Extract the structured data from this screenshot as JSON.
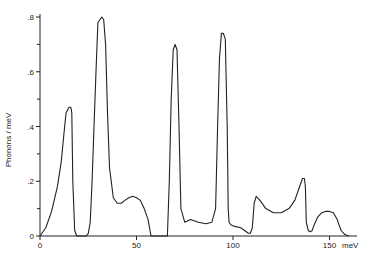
{
  "chart_data": {
    "type": "line",
    "title": "",
    "xlabel": "meV",
    "ylabel": "Phonons / meV",
    "xlim": [
      0,
      175
    ],
    "ylim": [
      0,
      0.8
    ],
    "x_ticks": [
      0,
      50,
      100,
      150
    ],
    "x_tick_labels": [
      "0",
      "50",
      "100",
      "150"
    ],
    "y_ticks": [
      0,
      0.2,
      0.4,
      0.6,
      0.8
    ],
    "y_tick_labels": [
      "0",
      ".2",
      ".4",
      ".6",
      ".8"
    ],
    "y_minor_ticks": [
      0.1,
      0.3,
      0.5,
      0.7
    ],
    "grid": false,
    "legend": null,
    "series": [
      {
        "name": "phonon density of states",
        "x": [
          0,
          3,
          6,
          9,
          11,
          12.5,
          13.5,
          15,
          16,
          16.5,
          17,
          18,
          19,
          22,
          24,
          25,
          26,
          27,
          28,
          29,
          30,
          32,
          33,
          34,
          35,
          36,
          38,
          40,
          42,
          44,
          46,
          48,
          50,
          52,
          54,
          56,
          57,
          57.5,
          66,
          67,
          68,
          69,
          70,
          71,
          72,
          73,
          75,
          78,
          82,
          86,
          89,
          91,
          92,
          93,
          94,
          95,
          96,
          97,
          97.5,
          98,
          99,
          101,
          104,
          106,
          108,
          109,
          110,
          111,
          112,
          114,
          117,
          121,
          125,
          129,
          132,
          134,
          136,
          137,
          137.5,
          138,
          139,
          140,
          141,
          142,
          144,
          146,
          148,
          150,
          152,
          154,
          156,
          158,
          160
        ],
        "y": [
          0,
          0.03,
          0.09,
          0.18,
          0.27,
          0.38,
          0.45,
          0.47,
          0.47,
          0.45,
          0.2,
          0.02,
          0,
          0,
          0,
          0.01,
          0.05,
          0.2,
          0.4,
          0.6,
          0.78,
          0.8,
          0.79,
          0.7,
          0.45,
          0.25,
          0.14,
          0.12,
          0.12,
          0.13,
          0.14,
          0.145,
          0.14,
          0.13,
          0.1,
          0.06,
          0.02,
          0,
          0,
          0.2,
          0.5,
          0.68,
          0.7,
          0.68,
          0.4,
          0.1,
          0.05,
          0.06,
          0.05,
          0.045,
          0.05,
          0.1,
          0.4,
          0.65,
          0.74,
          0.74,
          0.72,
          0.4,
          0.1,
          0.05,
          0.04,
          0.035,
          0.03,
          0.02,
          0.01,
          0.01,
          0.03,
          0.12,
          0.145,
          0.13,
          0.1,
          0.085,
          0.085,
          0.1,
          0.13,
          0.17,
          0.21,
          0.21,
          0.18,
          0.05,
          0.02,
          0.015,
          0.02,
          0.04,
          0.07,
          0.085,
          0.09,
          0.09,
          0.085,
          0.06,
          0.02,
          0.005,
          0
        ]
      }
    ]
  }
}
